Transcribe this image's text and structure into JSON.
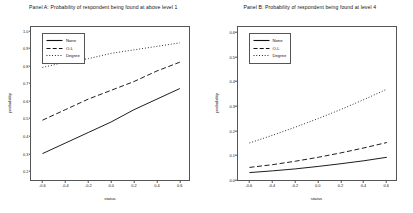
{
  "chart_data": [
    {
      "type": "line",
      "panel": "A",
      "title": "Panel A: Probability of respondent being found at above level 1",
      "xlabel": "status",
      "ylabel": "probability",
      "xlim": [
        -0.7,
        0.68
      ],
      "ylim": [
        0.15,
        1.02
      ],
      "xticks": [
        "-0.6",
        "-0.4",
        "-0.2",
        "0.0",
        "0.2",
        "0.4",
        "0.6"
      ],
      "xtickvalues": [
        -0.6,
        -0.4,
        -0.2,
        0.0,
        0.2,
        0.4,
        0.6
      ],
      "yticks": [
        "0.2",
        "0.3",
        "0.4",
        "0.5",
        "0.6",
        "0.7",
        "0.8",
        "0.9",
        "1.0"
      ],
      "ytickvalues": [
        0.2,
        0.3,
        0.4,
        0.5,
        0.6,
        0.7,
        0.8,
        0.9,
        1.0
      ],
      "grid": false,
      "legend_position": "top-left",
      "x": [
        -0.6,
        -0.4,
        -0.2,
        0.0,
        0.2,
        0.4,
        0.6
      ],
      "series": [
        {
          "name": "None",
          "style": "solid",
          "values": [
            0.3,
            0.36,
            0.42,
            0.48,
            0.55,
            0.61,
            0.67
          ]
        },
        {
          "name": "O-L",
          "style": "dashed",
          "values": [
            0.49,
            0.55,
            0.61,
            0.66,
            0.71,
            0.77,
            0.82
          ]
        },
        {
          "name": "Degree",
          "style": "dotted",
          "values": [
            0.79,
            0.82,
            0.84,
            0.87,
            0.89,
            0.91,
            0.93
          ]
        }
      ]
    },
    {
      "type": "line",
      "panel": "B",
      "title": "Panel B: Probability of respondent being found at level 4",
      "xlabel": "status",
      "ylabel": "probability",
      "xlim": [
        -0.7,
        0.68
      ],
      "ylim": [
        0.0,
        0.62
      ],
      "xticks": [
        "-0.6",
        "-0.4",
        "-0.2",
        "0.0",
        "0.2",
        "0.4",
        "0.6"
      ],
      "xtickvalues": [
        -0.6,
        -0.4,
        -0.2,
        0.0,
        0.2,
        0.4,
        0.6
      ],
      "yticks": [
        "0.0",
        "0.1",
        "0.2",
        "0.3",
        "0.4",
        "0.5",
        "0.6"
      ],
      "ytickvalues": [
        0.0,
        0.1,
        0.2,
        0.3,
        0.4,
        0.5,
        0.6
      ],
      "grid": false,
      "legend_position": "top-left",
      "x": [
        -0.6,
        -0.4,
        -0.2,
        0.0,
        0.2,
        0.4,
        0.6
      ],
      "series": [
        {
          "name": "None",
          "style": "solid",
          "values": [
            0.03,
            0.037,
            0.045,
            0.055,
            0.066,
            0.078,
            0.092
          ]
        },
        {
          "name": "O-L",
          "style": "dashed",
          "values": [
            0.051,
            0.062,
            0.076,
            0.092,
            0.11,
            0.13,
            0.152
          ]
        },
        {
          "name": "Degree",
          "style": "dotted",
          "values": [
            0.15,
            0.181,
            0.214,
            0.249,
            0.286,
            0.326,
            0.368
          ]
        }
      ]
    }
  ]
}
